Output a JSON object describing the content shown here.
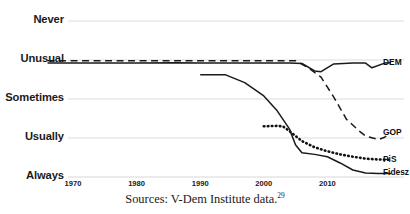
{
  "chart_data": {
    "type": "line",
    "title": "",
    "xlabel": "",
    "ylabel": "",
    "xlim": [
      1966,
      2020
    ],
    "ylim": [
      0,
      4
    ],
    "grid": true,
    "legend_position": "right-inline-labels",
    "x_ticks": [
      "1970",
      "1980",
      "1990",
      "2000",
      "2010"
    ],
    "x_tick_values": [
      1970,
      1980,
      1990,
      2000,
      2010
    ],
    "y_ticks": [
      "Never",
      "Unusual",
      "Sometimes",
      "Usually",
      "Always"
    ],
    "y_tick_values": [
      4,
      3,
      2,
      1,
      0
    ],
    "series": [
      {
        "name": "DEM",
        "style": "solid",
        "color": "#1a1a1a",
        "points": [
          [
            1966,
            2.92
          ],
          [
            1980,
            2.92
          ],
          [
            1986,
            2.93
          ],
          [
            1990,
            2.92
          ],
          [
            1996,
            2.92
          ],
          [
            2004,
            2.92
          ],
          [
            2006,
            2.91
          ],
          [
            2008,
            2.72
          ],
          [
            2009,
            2.7
          ],
          [
            2011,
            2.9
          ],
          [
            2014,
            2.92
          ],
          [
            2016,
            2.92
          ],
          [
            2017,
            2.8
          ],
          [
            2019,
            2.92
          ],
          [
            2020,
            2.93
          ]
        ]
      },
      {
        "name": "GOP",
        "style": "dashed",
        "color": "#1a1a1a",
        "points": [
          [
            1966,
            2.98
          ],
          [
            1980,
            2.98
          ],
          [
            1990,
            2.98
          ],
          [
            2000,
            2.98
          ],
          [
            2005,
            2.98
          ],
          [
            2007,
            2.8
          ],
          [
            2009,
            2.56
          ],
          [
            2011,
            2.05
          ],
          [
            2013,
            1.48
          ],
          [
            2015,
            1.18
          ],
          [
            2016,
            1.05
          ],
          [
            2018,
            0.96
          ],
          [
            2019,
            1.02
          ],
          [
            2020,
            1.14
          ]
        ]
      },
      {
        "name": "PiS",
        "style": "dotted",
        "color": "#111111",
        "points": [
          [
            2000,
            1.3
          ],
          [
            2002,
            1.31
          ],
          [
            2003,
            1.3
          ],
          [
            2004,
            1.18
          ],
          [
            2006,
            0.92
          ],
          [
            2008,
            0.76
          ],
          [
            2010,
            0.66
          ],
          [
            2012,
            0.58
          ],
          [
            2014,
            0.52
          ],
          [
            2016,
            0.47
          ],
          [
            2018,
            0.45
          ],
          [
            2020,
            0.44
          ]
        ]
      },
      {
        "name": "Fidesz",
        "style": "solid",
        "color": "#1a1a1a",
        "points": [
          [
            1990,
            2.62
          ],
          [
            1994,
            2.62
          ],
          [
            1997,
            2.42
          ],
          [
            2000,
            2.08
          ],
          [
            2002,
            1.72
          ],
          [
            2004,
            1.24
          ],
          [
            2005,
            0.82
          ],
          [
            2006,
            0.62
          ],
          [
            2008,
            0.58
          ],
          [
            2010,
            0.52
          ],
          [
            2012,
            0.36
          ],
          [
            2014,
            0.18
          ],
          [
            2016,
            0.1
          ],
          [
            2018,
            0.09
          ],
          [
            2020,
            0.09
          ]
        ]
      }
    ]
  },
  "caption": {
    "text": "Sources: V-Dem Institute data.",
    "note_marker": "29"
  },
  "series_labels": [
    {
      "name": "DEM",
      "label": "DEM"
    },
    {
      "name": "GOP",
      "label": "GOP"
    },
    {
      "name": "PiS",
      "label": "PiS"
    },
    {
      "name": "Fidesz",
      "label": "Fidesz"
    }
  ]
}
